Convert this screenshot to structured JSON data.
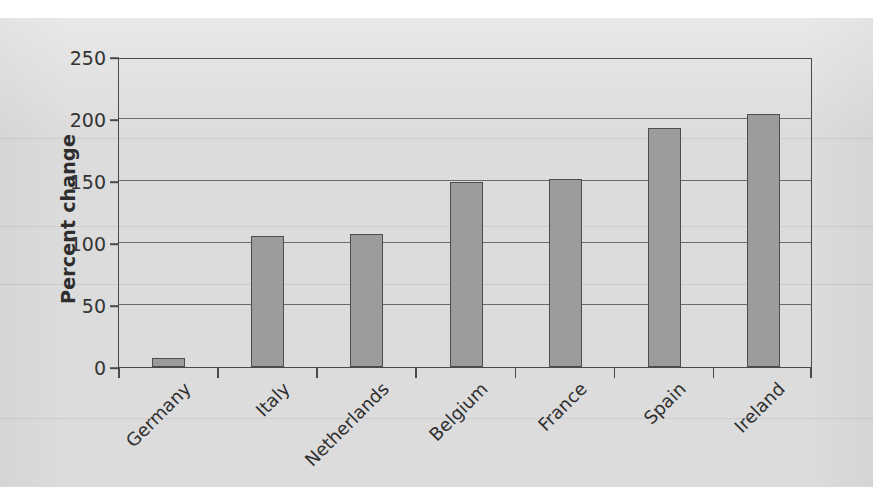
{
  "chart_data": {
    "type": "bar",
    "title": "",
    "subtitle": "",
    "xlabel": "",
    "ylabel": "Percent change",
    "categories": [
      "Germany",
      "Italy",
      "Netherlands",
      "Belgium",
      "France",
      "Spain",
      "Ireland"
    ],
    "values": [
      7,
      106,
      107,
      149,
      152,
      193,
      204
    ],
    "series": [
      {
        "name": "Percent change",
        "values": [
          7,
          106,
          107,
          149,
          152,
          193,
          204
        ]
      }
    ],
    "ylim": [
      0,
      250
    ],
    "yticks": [
      0,
      50,
      100,
      150,
      200,
      250
    ],
    "ytick_labels": [
      "0",
      "50",
      "100",
      "150",
      "200",
      "250"
    ],
    "grid": "horizontal",
    "legend": "none",
    "bar_color": "#9c9c9c",
    "bar_edge_color": "#4d4d4d",
    "axis_color": "#4a4a4a",
    "gridline_color": "#6b6b6b",
    "text_color": "#2f2f2f",
    "background_color": "#dcdcdc",
    "x_label_rotation": -45
  }
}
